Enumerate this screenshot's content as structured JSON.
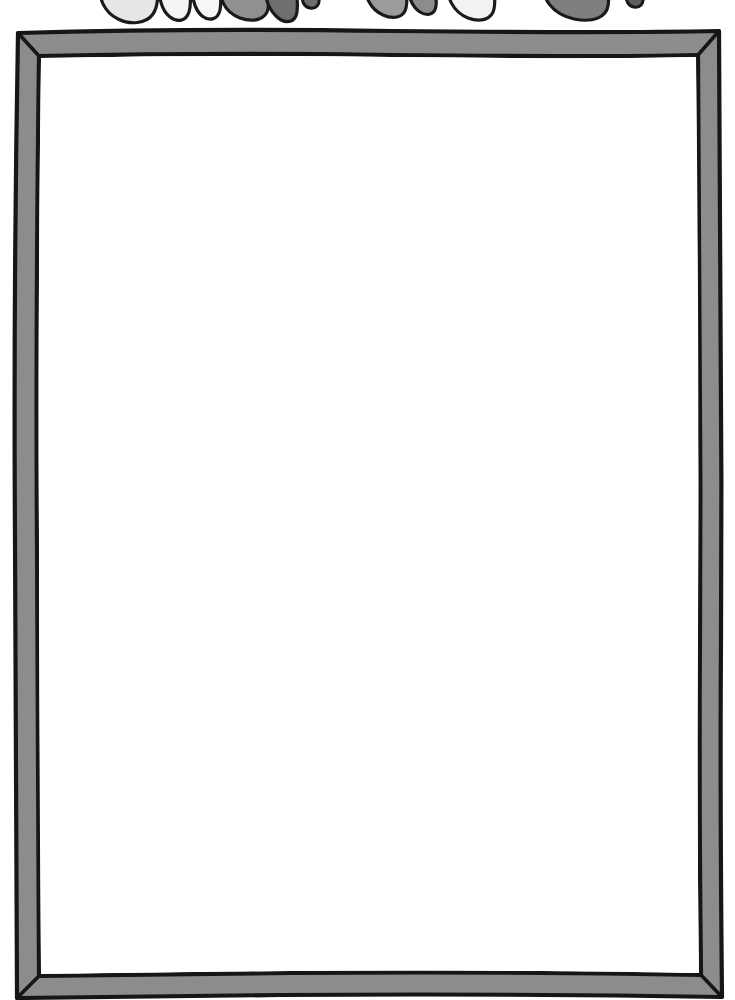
{
  "page": {
    "background_color": "#ffffff",
    "width": 735,
    "height": 1000
  },
  "title": {
    "text": "",
    "note": "Title lettering is cropped off at the top edge of the image; only the rounded bottoms of hand-drawn bubble letters remain visible",
    "style": "hand-drawn bubble letters",
    "visible_fragment_count": 9,
    "letter_fragments": [
      {
        "name": "fragment-1",
        "x": 104,
        "width": 46,
        "fill": "#e3e3e3",
        "shape": "round-bottom"
      },
      {
        "name": "fragment-2",
        "x": 158,
        "width": 26,
        "fill": "#f2f2f2",
        "shape": "narrow-round-bottom"
      },
      {
        "name": "fragment-3",
        "x": 190,
        "width": 24,
        "fill": "#f4f4f4",
        "shape": "narrow-round-bottom"
      },
      {
        "name": "fragment-4",
        "x": 220,
        "width": 44,
        "fill": "#8e8e8e",
        "shape": "round-bottom"
      },
      {
        "name": "fragment-5",
        "x": 262,
        "width": 32,
        "fill": "#707070",
        "shape": "angular-bottom"
      },
      {
        "name": "fragment-6",
        "x": 305,
        "width": 14,
        "fill": "#6e6e6e",
        "shape": "dot"
      },
      {
        "name": "fragment-7",
        "x": 370,
        "width": 40,
        "fill": "#9a9a9a",
        "shape": "round-bottom"
      },
      {
        "name": "fragment-8",
        "x": 412,
        "width": 26,
        "fill": "#8a8a8a",
        "shape": "round-bottom"
      },
      {
        "name": "fragment-9",
        "x": 452,
        "width": 44,
        "fill": "#f0f0f0",
        "shape": "round-bottom"
      },
      {
        "name": "fragment-10",
        "x": 548,
        "width": 58,
        "fill": "#7c7c7c",
        "shape": "wide-round-bottom"
      },
      {
        "name": "fragment-11",
        "x": 630,
        "width": 14,
        "fill": "#5e5e5e",
        "shape": "dot"
      }
    ]
  },
  "frame": {
    "name": "hand-drawn-border-box",
    "fill_color": "#8c8c8c",
    "outline_color": "#1c1c1c",
    "interior_color": "#ffffff",
    "band_thickness": 22,
    "style": "hand-drawn wobbly rectangle with mitered corners",
    "corners": [
      "top-left",
      "top-right",
      "bottom-right",
      "bottom-left"
    ],
    "bounds": {
      "left": 13,
      "top": 30,
      "right": 722,
      "bottom": 995
    }
  },
  "content": {
    "body_text": "",
    "note": "Interior of the frame is blank white — intended as a writing / drawing area"
  }
}
